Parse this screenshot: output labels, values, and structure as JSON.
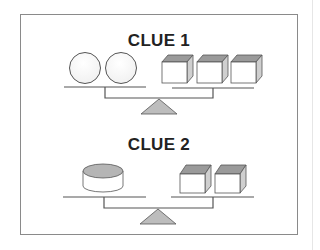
{
  "puzzle": {
    "clues": [
      {
        "title": "CLUE 1",
        "left_pan": {
          "object": "sphere",
          "count": 2
        },
        "right_pan": {
          "object": "cube",
          "count": 3
        }
      },
      {
        "title": "CLUE 2",
        "left_pan": {
          "object": "cylinder",
          "count": 1
        },
        "right_pan": {
          "object": "cube",
          "count": 2
        }
      }
    ]
  },
  "colors": {
    "frame": "#8a8a8a",
    "line": "#555555",
    "fulcrum": "#bdbdbd",
    "cube_top": "#9a9a9a",
    "cube_side": "#cfcfcf",
    "cylinder_top": "#b5b5b5"
  }
}
